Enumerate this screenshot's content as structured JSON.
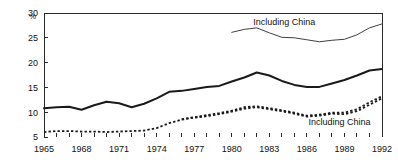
{
  "chart_data": {
    "type": "line",
    "title": "",
    "xlabel": "",
    "ylabel": "%",
    "unit_label": "%",
    "xlim": [
      1965,
      1992
    ],
    "ylim": [
      5,
      30
    ],
    "yticks": [
      5,
      10,
      15,
      20,
      25,
      30
    ],
    "ytick_labels": [
      "5",
      "10",
      "15",
      "20",
      "25",
      "30"
    ],
    "xticks": [
      1965,
      1966,
      1967,
      1968,
      1969,
      1970,
      1971,
      1972,
      1973,
      1974,
      1975,
      1976,
      1977,
      1978,
      1979,
      1980,
      1981,
      1982,
      1983,
      1984,
      1985,
      1986,
      1987,
      1988,
      1989,
      1990,
      1991,
      1992
    ],
    "xtick_labels_shown": [
      "1965",
      "1968",
      "1971",
      "1974",
      "1977",
      "1980",
      "1983",
      "1986",
      "1989",
      "1992"
    ],
    "xtick_label_years": [
      1965,
      1968,
      1971,
      1974,
      1977,
      1980,
      1983,
      1986,
      1989,
      1992
    ],
    "grid": false,
    "legend_position": "inline-annotation",
    "annotations": [
      {
        "text": "Including China",
        "x": 1984.2,
        "y": 27.6,
        "id": "annotation-upper"
      },
      {
        "text": "Including China",
        "x": 1988.6,
        "y": 7.4,
        "id": "annotation-lower"
      }
    ],
    "series": [
      {
        "name": "Including China (upper, thin solid)",
        "style": "thin-solid",
        "color": "#404040",
        "x": [
          1980,
          1981,
          1982,
          1983,
          1984,
          1985,
          1986,
          1987,
          1988,
          1989,
          1990,
          1991,
          1992
        ],
        "values": [
          26.1,
          26.7,
          27.0,
          26.0,
          25.1,
          25.0,
          24.6,
          24.2,
          24.5,
          24.7,
          25.6,
          27.0,
          27.8
        ]
      },
      {
        "name": "Total (thick solid)",
        "style": "thick-solid",
        "color": "#1a1a1a",
        "x": [
          1965,
          1966,
          1967,
          1968,
          1969,
          1970,
          1971,
          1972,
          1973,
          1974,
          1975,
          1976,
          1977,
          1978,
          1979,
          1980,
          1981,
          1982,
          1983,
          1984,
          1985,
          1986,
          1987,
          1988,
          1989,
          1990,
          1991,
          1992
        ],
        "values": [
          10.8,
          11.0,
          11.1,
          10.5,
          11.4,
          12.1,
          11.8,
          11.0,
          11.7,
          12.8,
          14.1,
          14.3,
          14.7,
          15.1,
          15.3,
          16.2,
          17.0,
          18.0,
          17.4,
          16.3,
          15.5,
          15.1,
          15.1,
          15.8,
          16.5,
          17.4,
          18.4,
          18.7
        ]
      },
      {
        "name": "Including China (lower, dashed upper)",
        "style": "dashed",
        "color": "#1a1a1a",
        "x": [
          1976,
          1977,
          1978,
          1979,
          1980,
          1981,
          1982,
          1983,
          1984,
          1985,
          1986,
          1987,
          1988,
          1989,
          1990,
          1991,
          1992
        ],
        "values": [
          8.6,
          9.0,
          9.4,
          9.8,
          10.3,
          11.0,
          11.2,
          10.8,
          10.4,
          9.9,
          9.3,
          9.5,
          9.9,
          9.9,
          10.6,
          12.0,
          13.2
        ]
      },
      {
        "name": "Excluding China (lower, dashed)",
        "style": "dashed",
        "color": "#1a1a1a",
        "x": [
          1965,
          1966,
          1967,
          1968,
          1969,
          1970,
          1971,
          1972,
          1973,
          1974,
          1975,
          1976,
          1977,
          1978,
          1979,
          1980,
          1981,
          1982,
          1983,
          1984,
          1985,
          1986,
          1987,
          1988,
          1989,
          1990,
          1991,
          1992
        ],
        "values": [
          6.0,
          6.2,
          6.2,
          6.1,
          6.1,
          6.0,
          6.1,
          6.2,
          6.3,
          6.8,
          7.8,
          8.5,
          8.9,
          9.2,
          9.6,
          10.1,
          10.7,
          11.0,
          10.6,
          10.2,
          9.7,
          9.1,
          9.3,
          9.7,
          9.6,
          10.2,
          11.5,
          12.8
        ]
      }
    ]
  }
}
